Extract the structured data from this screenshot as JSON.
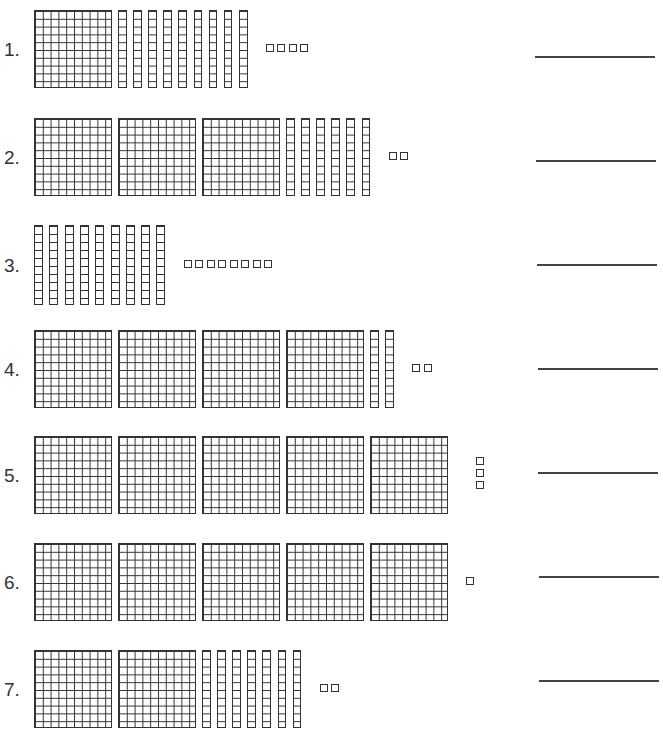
{
  "worksheet": {
    "type": "base-ten blocks place value",
    "problems": [
      {
        "label": "1.",
        "hundreds": 1,
        "tens": 9,
        "ones": 4,
        "top": 10,
        "size": 78,
        "ones_layout": "row"
      },
      {
        "label": "2.",
        "hundreds": 3,
        "tens": 6,
        "ones": 2,
        "top": 118,
        "size": 78,
        "ones_layout": "row"
      },
      {
        "label": "3.",
        "hundreds": 0,
        "tens": 9,
        "ones": 8,
        "top": 225,
        "size": 80,
        "ones_layout": "row"
      },
      {
        "label": "4.",
        "hundreds": 4,
        "tens": 2,
        "ones": 2,
        "top": 330,
        "size": 78,
        "ones_layout": "row"
      },
      {
        "label": "5.",
        "hundreds": 5,
        "tens": 0,
        "ones": 3,
        "top": 436,
        "size": 78,
        "ones_layout": "column"
      },
      {
        "label": "6.",
        "hundreds": 5,
        "tens": 0,
        "ones": 1,
        "top": 543,
        "size": 78,
        "ones_layout": "row"
      },
      {
        "label": "7.",
        "hundreds": 2,
        "tens": 7,
        "ones": 2,
        "top": 650,
        "size": 78,
        "ones_layout": "row"
      }
    ],
    "answer_lines": [
      {
        "top": 56,
        "left": 535,
        "width": 120
      },
      {
        "top": 160,
        "left": 536,
        "width": 120
      },
      {
        "top": 264,
        "left": 537,
        "width": 120
      },
      {
        "top": 368,
        "left": 538,
        "width": 120
      },
      {
        "top": 472,
        "left": 538,
        "width": 120
      },
      {
        "top": 576,
        "left": 539,
        "width": 120
      },
      {
        "top": 680,
        "left": 539,
        "width": 120
      }
    ],
    "colors": {
      "ink": "#333333",
      "background": "#ffffff"
    }
  }
}
